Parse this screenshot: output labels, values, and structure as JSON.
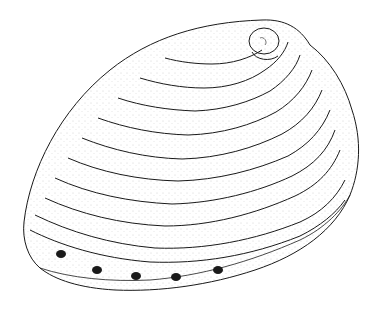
{
  "image": {
    "subject": "Line drawing of an abalone shell",
    "style": "black ink stipple illustration on white",
    "colors": {
      "background": "#ffffff",
      "ink": "#1a1a1a"
    },
    "features": {
      "growth_rings": 9,
      "respiratory_pores": 5,
      "apex_position": "upper right"
    }
  }
}
